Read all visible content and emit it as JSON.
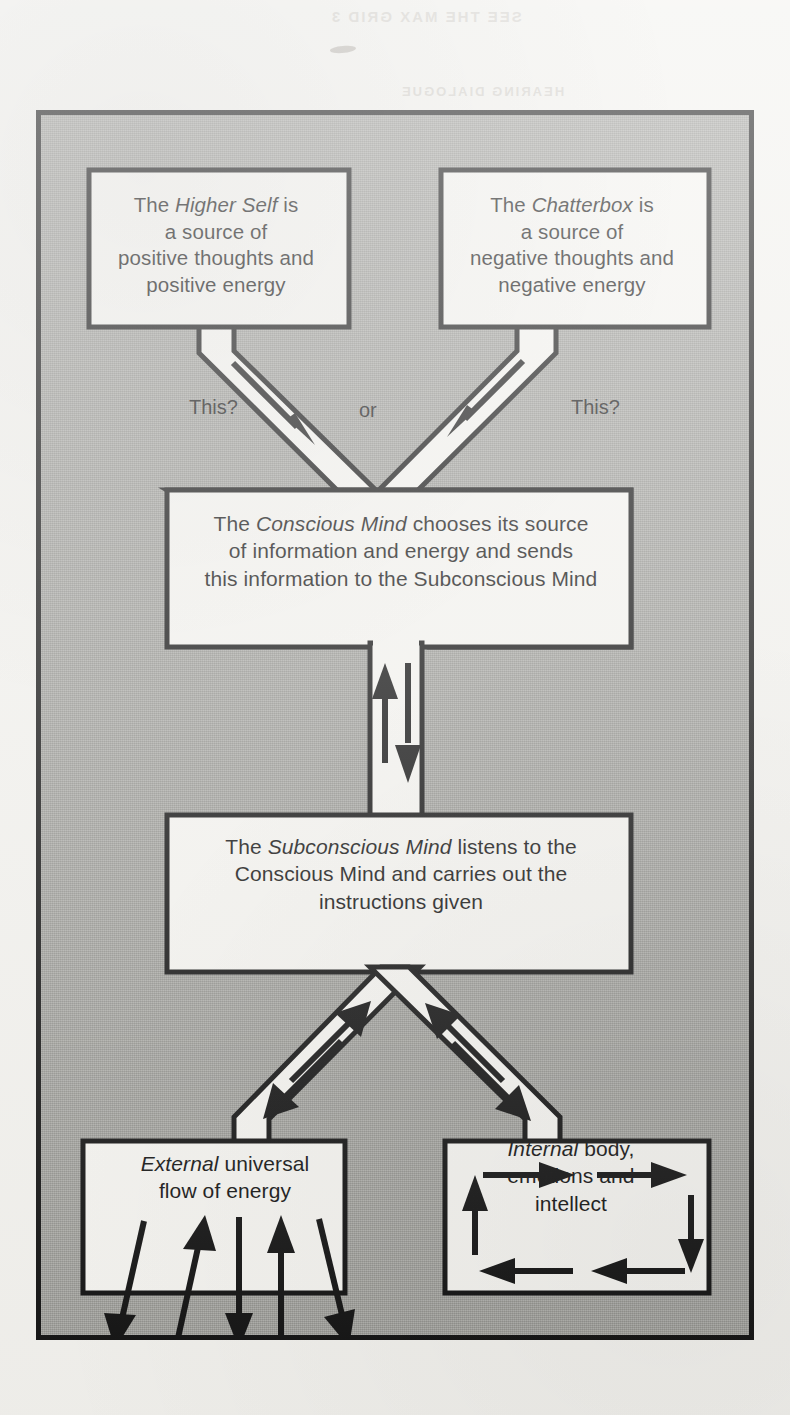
{
  "page": {
    "background_color": "#f2f1ed",
    "frame_fill": "#9e9e99",
    "ink_color": "#111111",
    "box_fill": "#f4f3ef"
  },
  "bleed_through": {
    "line_top": "SEE THE MAX GRID 3",
    "line_second": "HEARING DIALOGUE"
  },
  "diagram": {
    "title": "",
    "boxes": [
      {
        "id": "higher-self",
        "lines": [
          {
            "prefix": "The ",
            "emphasis": "Higher Self",
            "suffix": " is"
          },
          {
            "text": "a source of"
          },
          {
            "text": "positive thoughts and"
          },
          {
            "text": "positive energy"
          }
        ]
      },
      {
        "id": "chatterbox",
        "lines": [
          {
            "prefix": "The ",
            "emphasis": "Chatterbox",
            "suffix": " is"
          },
          {
            "text": "a source of"
          },
          {
            "text": "negative thoughts and"
          },
          {
            "text": "negative energy"
          }
        ]
      },
      {
        "id": "conscious-mind",
        "lines": [
          {
            "prefix": "The ",
            "emphasis": "Conscious Mind",
            "suffix": " chooses its source"
          },
          {
            "text": "of information and energy and sends"
          },
          {
            "text": "this information to the Subconscious Mind"
          }
        ]
      },
      {
        "id": "subconscious-mind",
        "lines": [
          {
            "prefix": "The ",
            "emphasis": "Subconscious Mind",
            "suffix": " listens to the"
          },
          {
            "text": "Conscious Mind and carries out the"
          },
          {
            "text": "instructions given"
          }
        ]
      },
      {
        "id": "external-energy",
        "lines": [
          {
            "prefix": "",
            "emphasis": "External",
            "suffix": " universal"
          },
          {
            "text": "flow of energy"
          }
        ]
      },
      {
        "id": "internal-body",
        "lines": [
          {
            "prefix": "",
            "emphasis": "Internal",
            "suffix": " body,"
          },
          {
            "text": "emotions and"
          },
          {
            "text": "intellect"
          }
        ]
      }
    ],
    "channel_labels": {
      "left": "This?",
      "middle": "or",
      "right": "This?"
    }
  }
}
